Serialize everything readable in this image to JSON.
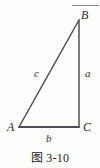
{
  "figure": {
    "caption": "图 3-10",
    "top_bleed_text": "",
    "background_color": "#fdfdfc",
    "stroke_color": "#4f4f52",
    "text_color": "#2c2c2c"
  },
  "diagram_data": {
    "type": "geometry-diagram",
    "shape": "right-triangle",
    "description": "Right triangle ABC with the right angle at C",
    "vertices": [
      {
        "name": "A",
        "label": "A",
        "x": 19,
        "y": 127,
        "position": "bottom-left"
      },
      {
        "name": "B",
        "label": "B",
        "x": 79,
        "y": 20,
        "position": "top-right"
      },
      {
        "name": "C",
        "label": "C",
        "x": 79,
        "y": 127,
        "position": "bottom-right"
      }
    ],
    "sides": [
      {
        "name": "a",
        "label": "a",
        "from": "B",
        "to": "C",
        "orientation": "vertical",
        "label_x": 85,
        "label_y": 68
      },
      {
        "name": "b",
        "label": "b",
        "from": "A",
        "to": "C",
        "orientation": "horizontal",
        "label_x": 46,
        "label_y": 133
      },
      {
        "name": "c",
        "label": "c",
        "from": "A",
        "to": "B",
        "orientation": "hypotenuse",
        "label_x": 34,
        "label_y": 68
      }
    ],
    "right_angle_at": "C"
  }
}
